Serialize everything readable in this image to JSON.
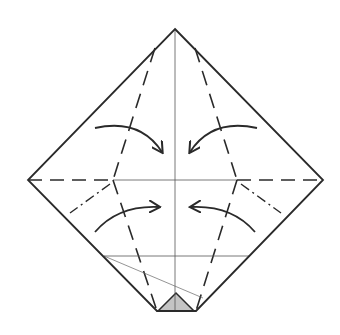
{
  "diagram": {
    "type": "origami-crease-pattern",
    "description": "Square paper in diamond orientation with valley folds, mountain folds and fold arrows",
    "colors": {
      "stroke": "#2a2a2a",
      "thin": "#555555",
      "fill_triangle": "#c4c4c4",
      "background": "#ffffff"
    },
    "outline": {
      "top": [
        175,
        29
      ],
      "right": [
        323,
        180
      ],
      "bottom_right": [
        196,
        311
      ],
      "bottom_left": [
        157,
        311
      ],
      "left": [
        28,
        180
      ]
    },
    "center_vertical": {
      "from": [
        175,
        29
      ],
      "to": [
        175,
        311
      ]
    },
    "horizontal_center": {
      "thin_segment": {
        "from": [
          113,
          180
        ],
        "to": [
          237,
          180
        ]
      },
      "dashed_left": {
        "from": [
          28,
          180
        ],
        "to": [
          113,
          180
        ]
      },
      "dashed_right": {
        "from": [
          237,
          180
        ],
        "to": [
          323,
          180
        ]
      }
    },
    "nodes": {
      "left": [
        113,
        180
      ],
      "right": [
        237,
        180
      ]
    },
    "valley_folds": [
      {
        "name": "upper-left",
        "from": [
          155,
          48
        ],
        "to": [
          113,
          180
        ]
      },
      {
        "name": "upper-right",
        "from": [
          195,
          48
        ],
        "to": [
          237,
          180
        ]
      },
      {
        "name": "lower-left",
        "from": [
          113,
          180
        ],
        "to": [
          157,
          311
        ]
      },
      {
        "name": "lower-right",
        "from": [
          237,
          180
        ],
        "to": [
          196,
          311
        ]
      }
    ],
    "mountain_folds": [
      {
        "name": "left",
        "from": [
          110,
          184
        ],
        "to": [
          70,
          213
        ]
      },
      {
        "name": "right",
        "from": [
          241,
          184
        ],
        "to": [
          281,
          213
        ]
      }
    ],
    "reference_lines": [
      {
        "name": "horizontal-lower",
        "from": [
          104,
          256
        ],
        "to": [
          250,
          256
        ]
      },
      {
        "name": "diagonal-thin",
        "from": [
          104,
          256
        ],
        "to": [
          203,
          298
        ]
      }
    ],
    "arrows": [
      {
        "name": "upper-left",
        "path": "M95,128 Q140,118 162,152",
        "head": [
          162,
          152
        ]
      },
      {
        "name": "upper-right",
        "path": "M257,128 Q212,118 190,152",
        "head": [
          190,
          152
        ]
      },
      {
        "name": "lower-left",
        "path": "M95,232 Q118,205 159,207",
        "head": [
          159,
          207
        ]
      },
      {
        "name": "lower-right",
        "path": "M255,232 Q232,205 191,207",
        "head": [
          191,
          207
        ]
      }
    ],
    "shaded_triangle": {
      "points": [
        [
          158,
          311
        ],
        [
          176,
          293
        ],
        [
          194,
          311
        ]
      ]
    }
  }
}
